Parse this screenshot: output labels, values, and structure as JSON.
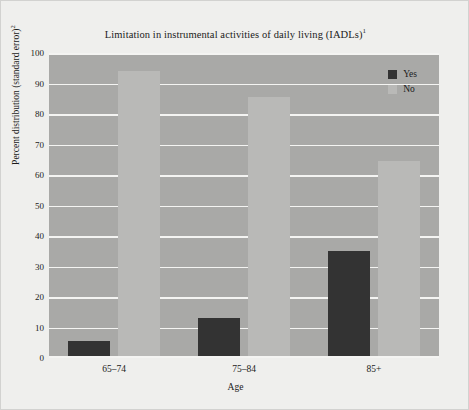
{
  "chart_data": {
    "type": "bar",
    "title": "Limitation in instrumental activities of daily living (IADLs)",
    "title_superscript": "1",
    "xlabel": "Age",
    "ylabel": "Percent distribution (standard error)",
    "ylabel_superscript": "2",
    "categories": [
      "65–74",
      "75–84",
      "85+"
    ],
    "ylim": [
      0,
      100
    ],
    "yticks": [
      100,
      90,
      80,
      70,
      60,
      50,
      40,
      30,
      20,
      10,
      0
    ],
    "grid": true,
    "legend_position": "top-right-inside",
    "series": [
      {
        "name": "Yes",
        "color": "#333333",
        "values": [
          5.5,
          13.0,
          35.0
        ]
      },
      {
        "name": "No",
        "color": "#b9b9b7",
        "values": [
          94.0,
          85.5,
          64.5
        ]
      }
    ]
  },
  "colors": {
    "page_background": "#efefed",
    "plot_background": "#a9a9a7",
    "gridline": "#f4f4f2",
    "series_yes": "#333333",
    "series_no": "#b9b9b7",
    "text": "#1b1b1b"
  }
}
